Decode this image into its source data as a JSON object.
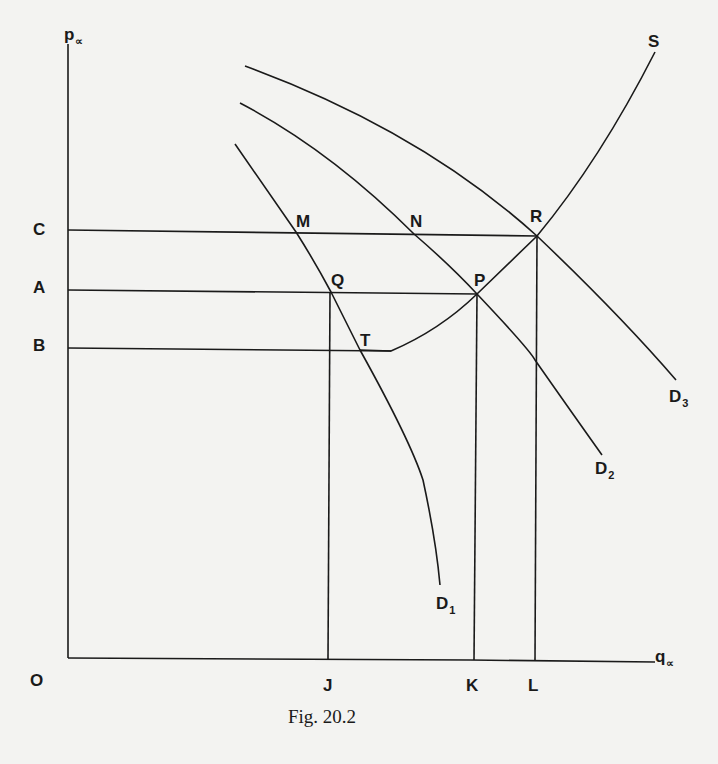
{
  "figure": {
    "caption": "Fig. 20.2",
    "axes": {
      "y_label": "p",
      "y_label_subscript": "∝",
      "x_label": "q",
      "x_label_subscript": "∝",
      "origin": "O"
    },
    "price_levels": {
      "C": "C",
      "A": "A",
      "B": "B"
    },
    "quantity_levels": {
      "J": "J",
      "K": "K",
      "L": "L"
    },
    "points": {
      "M": "M",
      "N": "N",
      "R": "R",
      "Q": "Q",
      "P": "P",
      "T": "T",
      "S": "S"
    },
    "curves": {
      "D1": {
        "name": "D",
        "sub": "1"
      },
      "D2": {
        "name": "D",
        "sub": "2"
      },
      "D3": {
        "name": "D",
        "sub": "3"
      },
      "S": {
        "name": "S"
      }
    },
    "line_color": "#1a1a1a",
    "background": "#f3f3f1"
  }
}
